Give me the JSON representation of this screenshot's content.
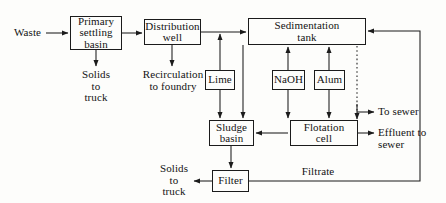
{
  "diagram": {
    "stroke_color": "#1b1b1b",
    "background_color": "#fdfdfb",
    "nodes": [
      {
        "id": "primary-settling-basin",
        "label": "Primary\nsettling\nbasin",
        "x": 70,
        "y": 16,
        "w": 52,
        "h": 34
      },
      {
        "id": "distribution-well",
        "label": "Distribution\nwell",
        "x": 144,
        "y": 19,
        "w": 57,
        "h": 26
      },
      {
        "id": "sedimentation-tank",
        "label": "Sedimentation\ntank",
        "x": 248,
        "y": 18,
        "w": 118,
        "h": 27
      },
      {
        "id": "lime",
        "label": "Lime",
        "x": 205,
        "y": 70,
        "w": 30,
        "h": 20
      },
      {
        "id": "naoh",
        "label": "NaOH",
        "x": 272,
        "y": 70,
        "w": 33,
        "h": 20
      },
      {
        "id": "alum",
        "label": "Alum",
        "x": 314,
        "y": 70,
        "w": 31,
        "h": 20
      },
      {
        "id": "sludge-basin",
        "label": "Sludge\nbasin",
        "x": 209,
        "y": 120,
        "w": 45,
        "h": 26
      },
      {
        "id": "flotation-cell",
        "label": "Flotation\ncell",
        "x": 290,
        "y": 120,
        "w": 68,
        "h": 26
      },
      {
        "id": "filter",
        "label": "Filter",
        "x": 212,
        "y": 170,
        "w": 37,
        "h": 22
      }
    ],
    "labels": [
      {
        "id": "waste",
        "text": "Waste",
        "x": 14,
        "y": 28,
        "w": 40,
        "align": "left"
      },
      {
        "id": "solids-to-truck-primary",
        "text": "Solids\nto\ntruck",
        "x": 74,
        "y": 71,
        "w": 44,
        "align": "center"
      },
      {
        "id": "recirculation-to-foundry",
        "text": "Recirculation\nto foundry",
        "x": 136,
        "y": 71,
        "w": 74,
        "align": "center"
      },
      {
        "id": "to-sewer",
        "text": "To sewer",
        "x": 378,
        "y": 109,
        "w": 60,
        "align": "left"
      },
      {
        "id": "effluent-to-sewer",
        "text": "Effluent to\nsewer",
        "x": 378,
        "y": 131,
        "w": 62,
        "align": "left"
      },
      {
        "id": "filtrate",
        "text": "Filtrate",
        "x": 294,
        "y": 168,
        "w": 48,
        "align": "center"
      },
      {
        "id": "solids-to-truck-filter",
        "text": "Solids\nto\ntruck",
        "x": 152,
        "y": 164,
        "w": 44,
        "align": "center"
      }
    ],
    "connections": [
      {
        "id": "waste-to-primary",
        "from": "waste",
        "to": "primary-settling-basin",
        "style": "solid"
      },
      {
        "id": "primary-to-distribution",
        "from": "primary-settling-basin",
        "to": "distribution-well",
        "style": "solid"
      },
      {
        "id": "primary-to-solids",
        "from": "primary-settling-basin",
        "to": "solids-to-truck-primary",
        "style": "solid"
      },
      {
        "id": "distribution-to-recirculation",
        "from": "distribution-well",
        "to": "recirculation-to-foundry",
        "style": "solid"
      },
      {
        "id": "distribution-to-sedimentation",
        "from": "distribution-well",
        "to": "sedimentation-tank",
        "style": "solid"
      },
      {
        "id": "lime-to-sedimentation",
        "from": "lime",
        "to": "sedimentation-tank",
        "style": "solid"
      },
      {
        "id": "lime-to-sludge",
        "from": "lime",
        "to": "sludge-basin",
        "style": "solid"
      },
      {
        "id": "naoh-to-sedimentation",
        "from": "naoh",
        "to": "sedimentation-tank",
        "style": "solid"
      },
      {
        "id": "naoh-to-flotation",
        "from": "naoh",
        "to": "flotation-cell",
        "style": "solid"
      },
      {
        "id": "alum-to-sedimentation",
        "from": "alum",
        "to": "sedimentation-tank",
        "style": "solid"
      },
      {
        "id": "alum-to-flotation",
        "from": "alum",
        "to": "flotation-cell",
        "style": "solid"
      },
      {
        "id": "sedimentation-to-sludge",
        "from": "sedimentation-tank",
        "to": "sludge-basin",
        "style": "solid"
      },
      {
        "id": "sedimentation-to-sewer",
        "from": "sedimentation-tank",
        "to": "to-sewer",
        "style": "dotted"
      },
      {
        "id": "flotation-to-sludge",
        "from": "flotation-cell",
        "to": "sludge-basin",
        "style": "solid"
      },
      {
        "id": "flotation-to-effluent",
        "from": "flotation-cell",
        "to": "effluent-to-sewer",
        "style": "solid"
      },
      {
        "id": "sludge-to-filter",
        "from": "sludge-basin",
        "to": "filter",
        "style": "solid"
      },
      {
        "id": "filter-to-solids",
        "from": "filter",
        "to": "solids-to-truck-filter",
        "style": "solid"
      },
      {
        "id": "filtrate-return",
        "from": "filter",
        "to": "sedimentation-tank",
        "style": "solid"
      }
    ]
  }
}
